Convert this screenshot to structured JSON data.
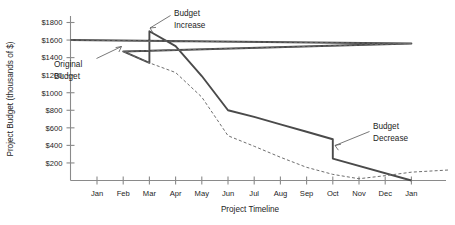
{
  "chart_data": {
    "type": "line",
    "title": "",
    "xlabel": "Project Timeline",
    "ylabel": "Project Budget (thousands of $)",
    "x": [
      "Jan",
      "Feb",
      "Mar",
      "Apr",
      "May",
      "Jun",
      "Jul",
      "Aug",
      "Sep",
      "Oct",
      "Nov",
      "Dec",
      "Jan"
    ],
    "xtick_labels": [
      "Jan",
      "Feb",
      "Mar",
      "Apr",
      "May",
      "Jun",
      "Jul",
      "Aug",
      "Sep",
      "Oct",
      "Nov",
      "Dec",
      "Jan"
    ],
    "ytick_labels": [
      "$200",
      "$400",
      "$600",
      "$800",
      "$1000",
      "$1200",
      "$1400",
      "$1600",
      "$1800"
    ],
    "ytick_values": [
      200,
      400,
      600,
      800,
      1000,
      1200,
      1400,
      1600,
      1800
    ],
    "ylim": [
      0,
      1800
    ],
    "grid": false,
    "legend_position": "none",
    "series": [
      {
        "name": "Revised Budget",
        "style": "solid",
        "color": "#4a4a4a",
        "note": "Starts at axis left of Jan at 1600; steps up at Mar (Budget Increase) and steps down at Oct (Budget Decrease)",
        "points": [
          {
            "x": "start",
            "y": 1600
          },
          {
            "x": "Jan",
            "y": 1560
          },
          {
            "x": "Feb",
            "y": 1470
          },
          {
            "x": "Mar",
            "y": 1340
          },
          {
            "x": "Mar",
            "y": 1700
          },
          {
            "x": "Apr",
            "y": 1530
          },
          {
            "x": "May",
            "y": 1190
          },
          {
            "x": "Jun",
            "y": 800
          },
          {
            "x": "Jul",
            "y": 725
          },
          {
            "x": "Aug",
            "y": 640
          },
          {
            "x": "Sep",
            "y": 555
          },
          {
            "x": "Oct",
            "y": 470
          },
          {
            "x": "Oct",
            "y": 250
          },
          {
            "x": "Jan",
            "y": 0
          }
        ]
      },
      {
        "name": "Original Budget",
        "style": "dashed",
        "color": "#6e6e6e",
        "note": "Coincides with revised budget until Mar, then continues declining to near zero by Nov and trails off past the final Jan tick",
        "points": [
          {
            "x": "start",
            "y": 1600
          },
          {
            "x": "Jan",
            "y": 1560
          },
          {
            "x": "Feb",
            "y": 1470
          },
          {
            "x": "Mar",
            "y": 1340
          },
          {
            "x": "Apr",
            "y": 1230
          },
          {
            "x": "May",
            "y": 950
          },
          {
            "x": "Jun",
            "y": 510
          },
          {
            "x": "Jul",
            "y": 390
          },
          {
            "x": "Aug",
            "y": 265
          },
          {
            "x": "Sep",
            "y": 150
          },
          {
            "x": "Oct",
            "y": 70
          },
          {
            "x": "Nov",
            "y": 20
          },
          {
            "x": "Dec",
            "y": 55
          },
          {
            "x": "Jan",
            "y": 95
          },
          {
            "x": "end",
            "y": 120
          }
        ]
      }
    ],
    "annotations": [
      {
        "id": "original-budget",
        "label_line1": "Original",
        "label_line2": "Budget",
        "points_to": "Original budget curve near Feb",
        "arrow": true
      },
      {
        "id": "budget-increase",
        "label_line1": "Budget",
        "label_line2": "Increase",
        "points_to": "Vertical step up at Mar",
        "arrow": true
      },
      {
        "id": "budget-decrease",
        "label_line1": "Budget",
        "label_line2": "Decrease",
        "points_to": "Vertical step down at Oct",
        "arrow": true
      }
    ]
  },
  "colors": {
    "axis": "#8a8a8a",
    "solid_series": "#4a4a4a",
    "dashed_series": "#6e6e6e",
    "text": "#1d1d1d",
    "background": "#ffffff"
  }
}
